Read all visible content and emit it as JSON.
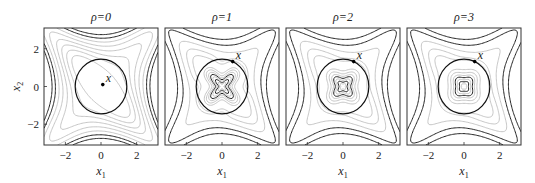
{
  "chart_data": [
    {
      "type": "contour",
      "title": "ρ=0",
      "rho": 0,
      "xlabel": "x1",
      "ylabel": "x2",
      "xlim": [
        -3.2,
        3.2
      ],
      "ylim": [
        -3.1,
        3.1
      ],
      "xticks": [
        -2,
        0,
        2
      ],
      "yticks": [
        -2,
        0,
        2
      ],
      "constraint_circle_radius": 1.45,
      "point": {
        "label": "x",
        "x": 0.1,
        "y": 0.1
      }
    },
    {
      "type": "contour",
      "title": "ρ=1",
      "rho": 1,
      "xlabel": "x1",
      "ylabel": "",
      "xlim": [
        -3.2,
        3.2
      ],
      "ylim": [
        -3.1,
        3.1
      ],
      "xticks": [
        -2,
        0,
        2
      ],
      "yticks": [],
      "constraint_circle_radius": 1.45,
      "point": {
        "label": "x",
        "x": 0.6,
        "y": 1.32
      }
    },
    {
      "type": "contour",
      "title": "ρ=2",
      "rho": 2,
      "xlabel": "x1",
      "ylabel": "",
      "xlim": [
        -3.2,
        3.2
      ],
      "ylim": [
        -3.1,
        3.1
      ],
      "xticks": [
        -2,
        0,
        2
      ],
      "yticks": [],
      "constraint_circle_radius": 1.45,
      "point": {
        "label": "x",
        "x": 0.6,
        "y": 1.32
      }
    },
    {
      "type": "contour",
      "title": "ρ=3",
      "rho": 3,
      "xlabel": "x1",
      "ylabel": "",
      "xlim": [
        -3.2,
        3.2
      ],
      "ylim": [
        -3.1,
        3.1
      ],
      "xticks": [
        -2,
        0,
        2
      ],
      "yticks": [],
      "constraint_circle_radius": 1.45,
      "point": {
        "label": "x",
        "x": 0.6,
        "y": 1.32
      }
    }
  ],
  "labels": {
    "titles": [
      "ρ=0",
      "ρ=1",
      "ρ=2",
      "ρ=3"
    ],
    "xlabel_main": "x",
    "xlabel_sub": "1",
    "ylabel_main": "x",
    "ylabel_sub": "2",
    "point_label": "x"
  },
  "colors": {
    "light_contour": "#b8b8b8",
    "dark_contour": "#222222",
    "circle": "#111111",
    "frame": "#333333"
  }
}
